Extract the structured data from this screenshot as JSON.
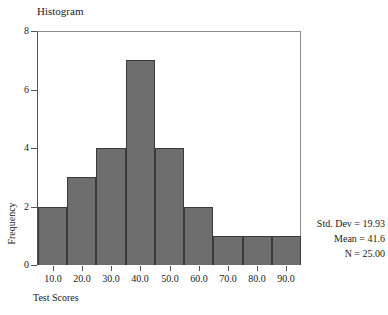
{
  "chart_data": {
    "type": "bar",
    "title": "Histogram",
    "xlabel": "Test Scores",
    "ylabel": "Frequency",
    "categories": [
      "10.0",
      "20.0",
      "30.0",
      "40.0",
      "50.0",
      "60.0",
      "70.0",
      "80.0",
      "90.0"
    ],
    "values": [
      2,
      3,
      4,
      7,
      4,
      2,
      1,
      1,
      1
    ],
    "x_tick_labels": [
      "10.0",
      "20.0",
      "30.0",
      "40.0",
      "50.0",
      "60.0",
      "70.0",
      "80.0",
      "90.0"
    ],
    "y_tick_labels": [
      "0",
      "2",
      "4",
      "6",
      "8"
    ],
    "y_tick_values": [
      0,
      2,
      4,
      6,
      8
    ],
    "ylim": [
      0,
      8
    ],
    "xlim": [
      5,
      95
    ],
    "bin_width": 10,
    "grid": false,
    "legend": false,
    "bar_color": "#6e6e6e",
    "bar_edge_color": "#3a3a3a",
    "frame_color": "#545454",
    "background": "#ffffff"
  },
  "annotations": {
    "std_dev_label": "Std. Dev = 19.93",
    "mean_label": "Mean = 41.6",
    "n_label": "N = 25.00"
  }
}
